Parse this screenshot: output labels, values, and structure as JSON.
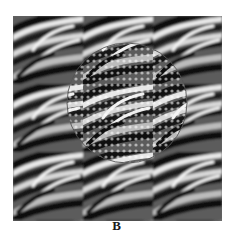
{
  "figure": {
    "panel_label": "B",
    "colors": {
      "dark": "#111111",
      "mid": "#777777",
      "light": "#f0f0f0",
      "circle_stroke": "#555555",
      "background": "#ffffff"
    },
    "tiling": {
      "columns": 3,
      "rows": 3
    },
    "circle": {
      "cx": 127,
      "cy": 103,
      "r": 60
    }
  }
}
